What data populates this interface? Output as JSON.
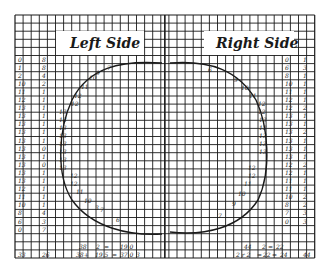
{
  "grid": {
    "x0": 15,
    "y0": 15,
    "cell": 8.1,
    "cols": 37,
    "rows": 30,
    "divider_col": 18.5,
    "line_color": "#1a1a1a"
  },
  "titles": {
    "left": "Left Side",
    "right": "Right Side"
  },
  "left_columns": {
    "col_a": [
      "0",
      "1",
      "2",
      "10",
      "11",
      "12",
      "13",
      "13",
      "13",
      "13",
      "13",
      "13",
      "13",
      "13",
      "13",
      "13",
      "12",
      "11",
      "10",
      "8",
      "6",
      "0"
    ],
    "col_b": [
      "8",
      "8",
      "4",
      "2",
      "1",
      "1",
      "1",
      "1",
      "1",
      "1",
      "1",
      "0",
      "1",
      "0",
      "1",
      "1",
      "1",
      "1",
      "1",
      "4",
      "3",
      "7"
    ]
  },
  "right_columns": {
    "col_a": [
      "0",
      "6",
      "8",
      "10",
      "11",
      "12",
      "12",
      "13",
      "13",
      "13",
      "13",
      "13",
      "13",
      "12",
      "12",
      "11",
      "11",
      "10",
      "8",
      "7",
      "0"
    ],
    "col_b": [
      "1",
      "3",
      "1",
      "1",
      "1",
      "1",
      "2",
      "1",
      "1",
      "2",
      "1",
      "1",
      "1",
      "2",
      "1",
      "1",
      "1",
      "2",
      "2",
      "3",
      "3"
    ]
  },
  "left_curve_labels": [
    "7",
    "9",
    "10",
    "11",
    "12",
    "12",
    "13",
    "13",
    "13",
    "13",
    "13",
    "13",
    "13",
    "13",
    "12",
    "12",
    "11",
    "10",
    "7",
    "6",
    "3"
  ],
  "right_curve_labels": [
    "6",
    "9",
    "10",
    "11",
    "12",
    "12",
    "13",
    "13",
    "13",
    "13",
    "13",
    "12",
    "12",
    "11",
    "10",
    "9",
    "7"
  ],
  "left_totals": {
    "row1": [
      "38",
      "2",
      "=",
      "19 0"
    ],
    "row2": [
      "33",
      "26",
      "38+",
      "19.5",
      "=",
      "37 0",
      "3"
    ]
  },
  "right_totals": {
    "row1": [
      "44",
      "2",
      "=",
      "22"
    ],
    "row2": [
      "2 r 2",
      "=",
      "22",
      "=",
      "24",
      "44"
    ]
  }
}
